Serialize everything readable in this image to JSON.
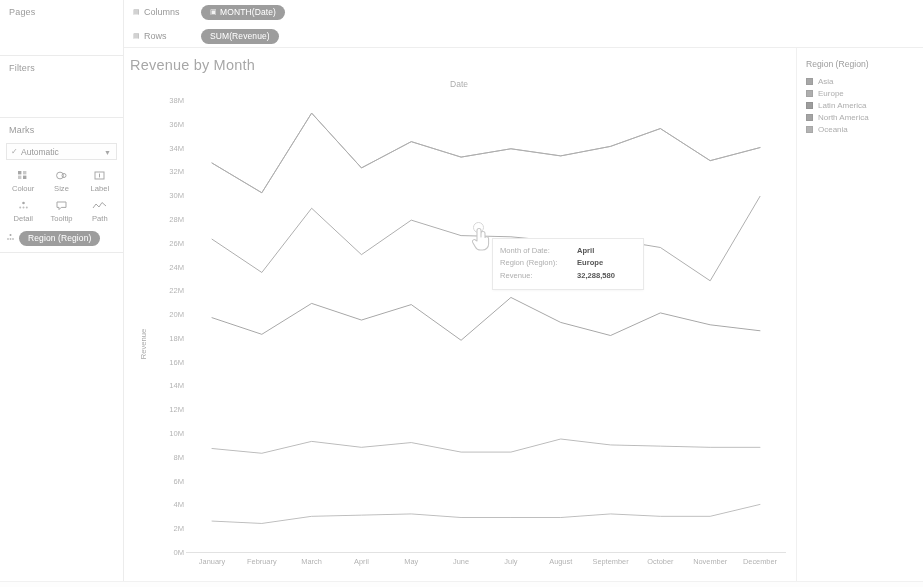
{
  "left_panel": {
    "pages": {
      "title": "Pages"
    },
    "filters": {
      "title": "Filters"
    },
    "marks": {
      "title": "Marks",
      "type_label": "Automatic",
      "type_check_icon": "check-icon",
      "caret_icon": "chevron-down-icon",
      "buttons": [
        {
          "label": "Colour",
          "icon": "colour-icon"
        },
        {
          "label": "Size",
          "icon": "size-icon"
        },
        {
          "label": "Label",
          "icon": "label-icon"
        },
        {
          "label": "Detail",
          "icon": "detail-icon"
        },
        {
          "label": "Tooltip",
          "icon": "tooltip-icon"
        },
        {
          "label": "Path",
          "icon": "path-icon"
        }
      ],
      "pill": {
        "label": "Region (Region)",
        "icon": "detail-icon"
      }
    }
  },
  "shelves": {
    "columns": {
      "label": "Columns",
      "icon": "shelf-icon",
      "pill": {
        "label": "MONTH(Date)",
        "icon": "calendar-icon"
      }
    },
    "rows": {
      "label": "Rows",
      "icon": "shelf-icon",
      "pill": {
        "label": "SUM(Revenue)",
        "icon": "measure-icon"
      }
    }
  },
  "viz": {
    "title": "Revenue by Month",
    "column_header": "Date"
  },
  "tooltip": {
    "rows": [
      {
        "key": "Month of Date:",
        "value": "April"
      },
      {
        "key": "Region (Region):",
        "value": "Europe"
      },
      {
        "key": "Revenue:",
        "value": "32,288,580"
      }
    ]
  },
  "legend": {
    "title": "Region (Region)",
    "items": [
      {
        "label": "Asia",
        "colour": "#9a9a9a"
      },
      {
        "label": "Europe",
        "colour": "#a2a2a2"
      },
      {
        "label": "Latin America",
        "colour": "#8f8f8f"
      },
      {
        "label": "North America",
        "colour": "#979797"
      },
      {
        "label": "Oceania",
        "colour": "#a8a8a8"
      }
    ]
  },
  "chart_data": {
    "type": "line",
    "title": "Revenue by Month",
    "xlabel": "Date",
    "ylabel": "Revenue",
    "column_header": "Date",
    "grid": false,
    "legend_position": "right",
    "ylim": [
      0,
      38000000
    ],
    "ytick_step": 2000000,
    "ytick_labels": [
      "38M",
      "36M",
      "34M",
      "32M",
      "30M",
      "28M",
      "26M",
      "24M",
      "22M",
      "20M",
      "18M",
      "16M",
      "14M",
      "12M",
      "10M",
      "8M",
      "6M",
      "4M",
      "2M",
      "0M"
    ],
    "ytick_values": [
      38000000,
      36000000,
      34000000,
      32000000,
      30000000,
      28000000,
      26000000,
      24000000,
      22000000,
      20000000,
      18000000,
      16000000,
      14000000,
      12000000,
      10000000,
      8000000,
      6000000,
      4000000,
      2000000,
      0
    ],
    "categories": [
      "January",
      "February",
      "March",
      "April",
      "May",
      "June",
      "July",
      "August",
      "September",
      "October",
      "November",
      "December"
    ],
    "series": [
      {
        "name": "Asia",
        "colour": "#9a9a9a",
        "values": [
          32700000,
          30200000,
          36900000,
          32288580,
          34500000,
          33200000,
          33900000,
          33300000,
          34100000,
          35600000,
          32900000,
          34000000
        ]
      },
      {
        "name": "Europe",
        "colour": "#a2a2a2",
        "values": [
          32700000,
          30200000,
          36900000,
          32288580,
          34500000,
          33200000,
          33900000,
          33300000,
          34100000,
          35600000,
          32900000,
          34000000
        ]
      },
      {
        "name": "North America",
        "colour": "#979797",
        "values": [
          26300000,
          23500000,
          28900000,
          25000000,
          27900000,
          26600000,
          26500000,
          26100000,
          26300000,
          25600000,
          22800000,
          29900000
        ]
      },
      {
        "name": "Latin America",
        "colour": "#8f8f8f",
        "values": [
          19700000,
          18300000,
          20900000,
          19500000,
          20800000,
          17800000,
          21400000,
          19300000,
          18200000,
          20100000,
          19100000,
          18600000
        ]
      },
      {
        "name": "Oceania",
        "colour": "#a8a8a8",
        "values": [
          8700000,
          8300000,
          9300000,
          8800000,
          9200000,
          8400000,
          8400000,
          9500000,
          9000000,
          8900000,
          8800000,
          8800000
        ]
      }
    ],
    "extra_series": [
      {
        "name": "lowest",
        "colour": "#ababab",
        "values": [
          2600000,
          2400000,
          3000000,
          3100000,
          3200000,
          2900000,
          2900000,
          2900000,
          3200000,
          3000000,
          3000000,
          4000000
        ]
      }
    ],
    "highlighted_point": {
      "series": "Europe",
      "category": "April",
      "value": 32288580
    }
  }
}
